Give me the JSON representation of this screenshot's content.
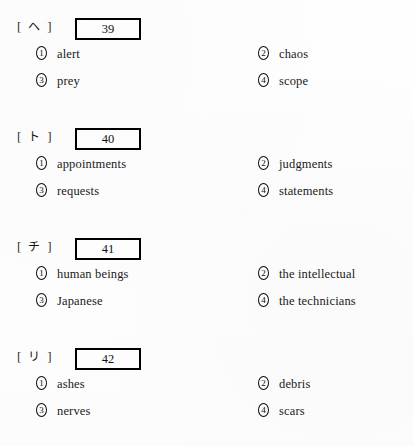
{
  "document": {
    "type": "vocabulary-multiple-choice-worksheet",
    "background_color": "#ffffff",
    "text_color": "#1a1a1a",
    "box_border_color": "#000000"
  },
  "questions": [
    {
      "bracket_open": "[",
      "bracket_close": "]",
      "kana_label": "ヘ",
      "number": "39",
      "options": [
        {
          "marker_digit": "1",
          "marker_name": "circled-one",
          "text": "alert"
        },
        {
          "marker_digit": "2",
          "marker_name": "circled-two",
          "text": "chaos"
        },
        {
          "marker_digit": "3",
          "marker_name": "circled-three",
          "text": "prey"
        },
        {
          "marker_digit": "4",
          "marker_name": "circled-four",
          "text": "scope"
        }
      ]
    },
    {
      "bracket_open": "[",
      "bracket_close": "]",
      "kana_label": "ト",
      "number": "40",
      "options": [
        {
          "marker_digit": "1",
          "marker_name": "circled-one",
          "text": "appointments"
        },
        {
          "marker_digit": "2",
          "marker_name": "circled-two",
          "text": "judgments"
        },
        {
          "marker_digit": "3",
          "marker_name": "circled-three",
          "text": "requests"
        },
        {
          "marker_digit": "4",
          "marker_name": "circled-four",
          "text": "statements"
        }
      ]
    },
    {
      "bracket_open": "[",
      "bracket_close": "]",
      "kana_label": "チ",
      "number": "41",
      "options": [
        {
          "marker_digit": "1",
          "marker_name": "circled-one",
          "text": "human beings"
        },
        {
          "marker_digit": "2",
          "marker_name": "circled-two",
          "text": "the intellectual"
        },
        {
          "marker_digit": "3",
          "marker_name": "circled-three",
          "text": "Japanese"
        },
        {
          "marker_digit": "4",
          "marker_name": "circled-four",
          "text": "the technicians"
        }
      ]
    },
    {
      "bracket_open": "[",
      "bracket_close": "]",
      "kana_label": "リ",
      "number": "42",
      "options": [
        {
          "marker_digit": "1",
          "marker_name": "circled-one",
          "text": "ashes"
        },
        {
          "marker_digit": "2",
          "marker_name": "circled-two",
          "text": "debris"
        },
        {
          "marker_digit": "3",
          "marker_name": "circled-three",
          "text": "nerves"
        },
        {
          "marker_digit": "4",
          "marker_name": "circled-four",
          "text": "scars"
        }
      ]
    }
  ]
}
